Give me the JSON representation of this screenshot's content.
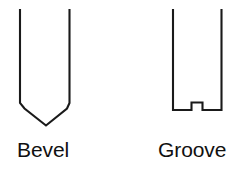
{
  "figure": {
    "background_color": "#ffffff",
    "stroke_color": "#1a1a1a",
    "text_color": "#101010",
    "width": 252,
    "height": 172
  },
  "shapes": [
    {
      "id": "bevel",
      "caption": "Bevel",
      "description": "Open-topped channel profile whose bottom tapers through short chamfers into a V point",
      "path": "M 20 9 L 20 103 L 24.5 108.5 L 46 125.5 L 67 108.5 L 69.5 103 L 69.5 9"
    },
    {
      "id": "groove",
      "caption": "Groove",
      "description": "Open-topped rectangular profile with a small square groove bump at the bottom centre",
      "path": "M 173 9 L 173 110 L 191.5 110 L 191.5 102.5 L 202.5 102.5 L 202.5 110 L 221.5 110 L 221.5 9"
    }
  ],
  "captions": {
    "bevel": "Bevel",
    "groove": "Groove"
  }
}
